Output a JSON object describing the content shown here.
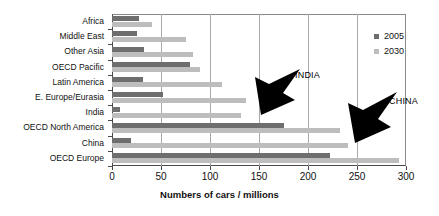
{
  "chart_data": {
    "type": "bar",
    "orientation": "horizontal",
    "title": "",
    "xlabel": "Numbers of cars / millions",
    "ylabel": "",
    "xlim": [
      0,
      300
    ],
    "xticks": [
      0,
      50,
      100,
      150,
      200,
      250,
      300
    ],
    "grid": true,
    "legend_position": "top-right",
    "categories": [
      "Africa",
      "Middle East",
      "Other Asia",
      "OECD Pacific",
      "Latin America",
      "E. Europe/Eurasia",
      "India",
      "OECD North America",
      "China",
      "OECD Europe"
    ],
    "series": [
      {
        "name": "2005",
        "color": "#6e6e6e",
        "values": [
          28,
          26,
          33,
          80,
          32,
          52,
          8,
          176,
          19,
          222
        ]
      },
      {
        "name": "2030",
        "color": "#bdbdbd",
        "values": [
          41,
          76,
          83,
          90,
          112,
          137,
          132,
          233,
          241,
          293
        ]
      }
    ],
    "annotations": [
      {
        "text": "INDIA",
        "target_category": "India",
        "target_series": "2030"
      },
      {
        "text": "CHINA",
        "target_category": "China",
        "target_series": "2030"
      }
    ]
  },
  "legend": {
    "items": [
      {
        "label": "2005",
        "color": "#6e6e6e"
      },
      {
        "label": "2030",
        "color": "#bdbdbd"
      }
    ]
  },
  "axis": {
    "x_title": "Numbers of cars / millions",
    "x_tick_labels": [
      "0",
      "50",
      "100",
      "150",
      "200",
      "250",
      "300"
    ]
  },
  "annotations": {
    "india": "INDIA",
    "china": "CHINA"
  }
}
